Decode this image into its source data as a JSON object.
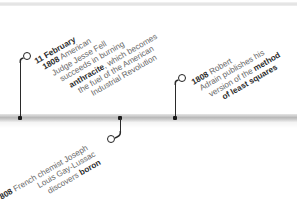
{
  "timeline": {
    "colors": {
      "bar": "#bdbdbd",
      "stem": "#2a2a2a",
      "text": "#6a6a6a",
      "bold_text": "#2b2b2b"
    },
    "events": [
      {
        "id": "anthracite",
        "position": "above",
        "lines": [
          {
            "bold": "11 February",
            "text": ""
          },
          {
            "bold": "1808",
            "text": " American"
          },
          {
            "bold": "",
            "text": "Judge Jesse Fell"
          },
          {
            "bold": "",
            "text": "succeeds in burning"
          },
          {
            "bold": "anthracite",
            "text": ", which becomes"
          },
          {
            "bold": "",
            "text": "the fuel of the American"
          },
          {
            "bold": "",
            "text": "Industrial Revolution"
          }
        ]
      },
      {
        "id": "boron",
        "position": "below",
        "lines": [
          {
            "bold": "1808",
            "text": " French chemist Joseph"
          },
          {
            "bold": "",
            "text": "Louis Gay-Lussac"
          },
          {
            "pre": "discovers ",
            "bold": "boron",
            "text": ""
          }
        ]
      },
      {
        "id": "least-squares",
        "position": "above",
        "lines": [
          {
            "bold": "1808",
            "text": " Robert"
          },
          {
            "bold": "",
            "text": "Adrain publishes his"
          },
          {
            "pre": "version of the ",
            "bold": "method",
            "text": ""
          },
          {
            "bold": "of least squares",
            "text": ""
          }
        ]
      }
    ]
  }
}
